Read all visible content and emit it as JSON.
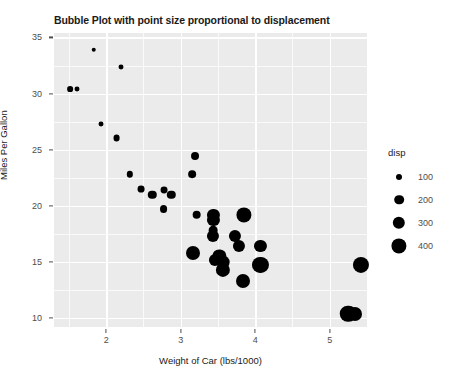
{
  "chart_data": {
    "type": "scatter",
    "title": "Bubble Plot with point size proportional to displacement",
    "xlabel": "Weight of Car (lbs/1000)",
    "ylabel": "Miles Per Gallon",
    "xlim": [
      1.3,
      5.5
    ],
    "ylim": [
      9.2,
      35.4
    ],
    "xticks": [
      "2",
      "3",
      "4",
      "5"
    ],
    "xtick_values": [
      2,
      3,
      4,
      5
    ],
    "yticks": [
      "10",
      "15",
      "20",
      "25",
      "30",
      "35"
    ],
    "ytick_values": [
      10,
      15,
      20,
      25,
      30,
      35
    ],
    "grid": true,
    "legend_position": "right",
    "size_legend": {
      "title": "disp",
      "entries": [
        {
          "label": "100",
          "value": 100,
          "radius_px": 3.0
        },
        {
          "label": "200",
          "value": 200,
          "radius_px": 4.8
        },
        {
          "label": "300",
          "value": 300,
          "radius_px": 6.2
        },
        {
          "label": "400",
          "value": 400,
          "radius_px": 7.6
        }
      ]
    },
    "size_field": "disp",
    "point_color": "#000000",
    "panel_color": "#ebebeb",
    "grid_color": "#ffffff",
    "points": [
      {
        "x": 1.513,
        "y": 30.4,
        "size": 95.1
      },
      {
        "x": 1.615,
        "y": 30.4,
        "size": 79.0
      },
      {
        "x": 1.835,
        "y": 33.9,
        "size": 71.1
      },
      {
        "x": 1.935,
        "y": 27.3,
        "size": 79.0
      },
      {
        "x": 2.14,
        "y": 26.0,
        "size": 120.3
      },
      {
        "x": 2.2,
        "y": 32.4,
        "size": 78.7
      },
      {
        "x": 2.32,
        "y": 22.8,
        "size": 108.0
      },
      {
        "x": 2.465,
        "y": 21.5,
        "size": 120.1
      },
      {
        "x": 2.62,
        "y": 21.0,
        "size": 160.0
      },
      {
        "x": 2.77,
        "y": 19.7,
        "size": 145.0
      },
      {
        "x": 2.78,
        "y": 21.4,
        "size": 121.0
      },
      {
        "x": 2.875,
        "y": 21.0,
        "size": 160.0
      },
      {
        "x": 3.15,
        "y": 22.8,
        "size": 140.8
      },
      {
        "x": 3.17,
        "y": 15.8,
        "size": 351.0
      },
      {
        "x": 3.19,
        "y": 24.4,
        "size": 146.7
      },
      {
        "x": 3.215,
        "y": 19.2,
        "size": 167.6
      },
      {
        "x": 3.435,
        "y": 17.3,
        "size": 275.8
      },
      {
        "x": 3.44,
        "y": 18.7,
        "size": 275.8
      },
      {
        "x": 3.44,
        "y": 19.2,
        "size": 275.8
      },
      {
        "x": 3.44,
        "y": 17.8,
        "size": 167.6
      },
      {
        "x": 3.46,
        "y": 15.2,
        "size": 275.8
      },
      {
        "x": 3.52,
        "y": 15.5,
        "size": 318.0
      },
      {
        "x": 3.57,
        "y": 14.3,
        "size": 360.0
      },
      {
        "x": 3.57,
        "y": 15.0,
        "size": 301.0
      },
      {
        "x": 3.73,
        "y": 17.3,
        "size": 275.8
      },
      {
        "x": 3.78,
        "y": 16.4,
        "size": 275.8
      },
      {
        "x": 3.84,
        "y": 13.3,
        "size": 350.0
      },
      {
        "x": 3.845,
        "y": 19.2,
        "size": 400.0
      },
      {
        "x": 4.07,
        "y": 14.7,
        "size": 440.0
      },
      {
        "x": 4.07,
        "y": 16.4,
        "size": 275.8
      },
      {
        "x": 5.25,
        "y": 10.4,
        "size": 460.0
      },
      {
        "x": 5.345,
        "y": 10.4,
        "size": 350.0
      },
      {
        "x": 5.424,
        "y": 14.7,
        "size": 440.0
      }
    ]
  }
}
